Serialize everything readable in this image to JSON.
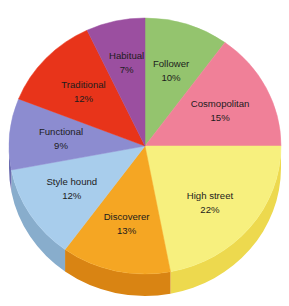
{
  "chart_data": {
    "type": "pie",
    "title": "",
    "subtitle": "",
    "xlabel": "",
    "ylabel": "",
    "legend_position": "none",
    "labels_inside_slices": true,
    "grid": false,
    "three_d": true,
    "start_angle_deg": 0,
    "direction": "clockwise",
    "total": 100,
    "value_suffix": "%",
    "categories": [
      "Follower",
      "Cosmopolitan",
      "High street",
      "Discoverer",
      "Style hound",
      "Functional",
      "Traditional",
      "Habitual"
    ],
    "values": [
      10,
      15,
      22,
      13,
      12,
      9,
      12,
      7
    ],
    "colors": [
      "#94C46E",
      "#F08098",
      "#F7F07E",
      "#F5A623",
      "#A8CDEC",
      "#8C8CD0",
      "#E8341A",
      "#9B4FA0"
    ],
    "side_colors": [
      "#74A44E",
      "#D06078",
      "#EDD94E",
      "#D98413",
      "#88ADCC",
      "#6C6CB0",
      "#C8240A",
      "#7B2F80"
    ],
    "slices": [
      {
        "label": "Follower",
        "value": 10,
        "value_label": "10%",
        "color": "#94C46E",
        "side_color": "#74A44E"
      },
      {
        "label": "Cosmopolitan",
        "value": 15,
        "value_label": "15%",
        "color": "#F08098",
        "side_color": "#D06078"
      },
      {
        "label": "High street",
        "value": 22,
        "value_label": "22%",
        "color": "#F7F07E",
        "side_color": "#EDD94E"
      },
      {
        "label": "Discoverer",
        "value": 13,
        "value_label": "13%",
        "color": "#F5A623",
        "side_color": "#D98413"
      },
      {
        "label": "Style hound",
        "value": 12,
        "value_label": "12%",
        "color": "#A8CDEC",
        "side_color": "#88ADCC"
      },
      {
        "label": "Functional",
        "value": 9,
        "value_label": "9%",
        "color": "#8C8CD0",
        "side_color": "#6C6CB0"
      },
      {
        "label": "Traditional",
        "value": 12,
        "value_label": "12%",
        "color": "#E8341A",
        "side_color": "#C8240A"
      },
      {
        "label": "Habitual",
        "value": 7,
        "value_label": "7%",
        "color": "#9B4FA0",
        "side_color": "#7B2F80"
      }
    ]
  },
  "geometry": {
    "cx": 145,
    "cy": 146,
    "rx": 136,
    "ry": 128,
    "depth": 22,
    "label_radius_factor": 0.62,
    "label_line_gap": 12
  },
  "background": {
    "color": "#ffffff"
  }
}
